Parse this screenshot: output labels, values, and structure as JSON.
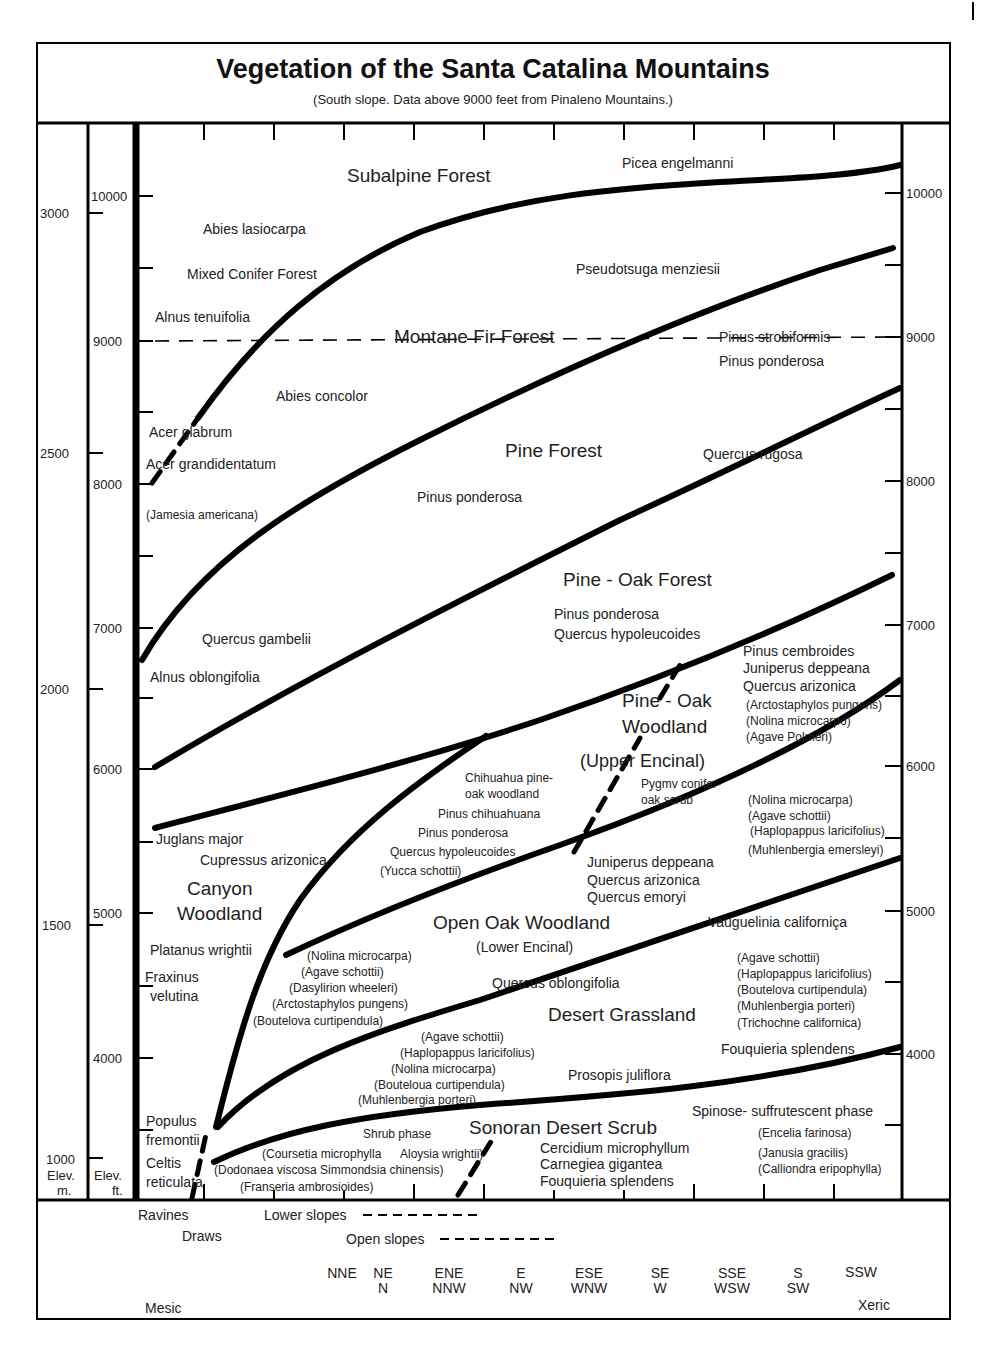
{
  "header": {
    "title": "Vegetation of the Santa Catalina Mountains",
    "subtitle": "(South slope. Data above 9000 feet from Pinaleno Mountains.)"
  },
  "axes": {
    "meters_label_1": "Elev.",
    "meters_label_2": "m.",
    "feet_label_1": "Elev.",
    "feet_label_2": "ft.",
    "meters_ticks": [
      "3000",
      "2500",
      "2000",
      "1500",
      "1000"
    ],
    "feet_ticks_left": [
      "10000",
      "9000",
      "8000",
      "7000",
      "6000",
      "5000",
      "4000"
    ],
    "feet_ticks_right": [
      "10000",
      "9000",
      "8000",
      "7000",
      "6000",
      "5000",
      "4000"
    ]
  },
  "zones": {
    "subalpine": "Subalpine Forest",
    "montane": "Montane Fir Forest",
    "pine": "Pine Forest",
    "pine_oak_forest": "Pine - Oak Forest",
    "pine_oak_woodland_1": "Pine - Oak",
    "pine_oak_woodland_2": "Woodland",
    "upper_encinal": "(Upper Encinal)",
    "canyon_1": "Canyon",
    "canyon_2": "Woodland",
    "open_oak": "Open Oak Woodland",
    "lower_encinal": "(Lower Encinal)",
    "desert_grassland": "Desert Grassland",
    "sonoran": "Sonoran Desert Scrub"
  },
  "species": {
    "picea": "Picea engelmanni",
    "abies_lasiocarpa": "Abies lasiocarpa",
    "mixed_conifer": "Mixed Conifer Forest",
    "alnus_tenuifolia": "Alnus tenuifolia",
    "pseudotsuga": "Pseudotsuga menziesii",
    "pinus_strobiformis": "Pinus strobiformis",
    "pinus_ponderosa_1": "Pinus ponderosa",
    "abies_concolor": "Abies concolor",
    "acer_glabrum": "Acer glabrum",
    "acer_grandidentatum": "Acer grandidentatum",
    "jamesia": "(Jamesia americana)",
    "pinus_ponderosa_2": "Pinus ponderosa",
    "quercus_rugosa": "Quercus rugosa",
    "quercus_gambelii": "Quercus gambelii",
    "alnus_oblongifolia": "Alnus oblongifolia",
    "pinus_ponderosa_3": "Pinus ponderosa",
    "quercus_hypoleucoides_1": "Quercus hypoleucoides",
    "pinus_cembroides": "Pinus cembroides",
    "juniperus_deppeana_1": "Juniperus deppeana",
    "quercus_arizonica_1": "Quercus arizonica",
    "arctostaphylos_1": "(Arctostaphylos pungens)",
    "nolina_microcarpo": "(Nolina microcarpo)",
    "agave_polmeri": "(Agave Polmeri)",
    "chihuahua_1": "Chihuahua pine-",
    "chihuahua_2": "oak woodland",
    "pinus_chihuahuana": "Pinus chihuahuana",
    "pinus_ponderosa_4": "Pinus ponderosa",
    "quercus_hypoleucoides_2": "Quercus hypoleucoides",
    "yucca": "(Yucca schottii)",
    "pygmy_1": "Pygmv conifer-",
    "pygmy_2": "oak scrub",
    "nolina_r1": "(Nolina microcarpa)",
    "agave_r1": "(Agave schottii)",
    "haplopappus_r1": "(Haplopappus laricifolius)",
    "muhlenbergia_emersleyi": "(Muhlenbergia emersleyi)",
    "juglans": "Juglans major",
    "cupressus": "Cupressus arizonica",
    "juniperus_deppeana_2": "Juniperus deppeana",
    "quercus_arizonica_2": "Quercus arizonica",
    "quercus_emoryi": "Quercus emoryi",
    "vauquelinia": "Vauguelinia californiça",
    "platanus": "Platanus wrightii",
    "fraxinus_1": "Fraxinus",
    "fraxinus_2": "velutina",
    "nolina_l": "(Nolina microcarpa)",
    "agave_l": "(Agave schottii)",
    "dasylirion": "(Dasylirion wheeleri)",
    "arctostaphylos_2": "(Arctostaphylos pungens)",
    "boutelova_l": "(Boutelova curtipendula)",
    "quercus_oblongifolia": "Quercus oblongifolia",
    "agave_m": "(Agave schottii)",
    "haplopappus_m": "(Haplopappus laricifolius)",
    "nolina_m": "(Nolina microcarpa)",
    "bouteloua_m": "(Bouteloua curtipendula)",
    "muhlenbergia_m": "(Muhlenbergia porteri)",
    "agave_r2": "(Agave schottii)",
    "haplopappus_r2": "(Haplopappus laricifolius)",
    "boutelova_r2": "(Boutelova curtipendula)",
    "muhlenbergia_r2": "(Muhlenbergia porteri)",
    "trichochne": "(Trichochne californica)",
    "fouquieria_1": "Fouquieria splendens",
    "prosopis": "Prosopis juliflora",
    "populus_1": "Populus",
    "populus_2": "fremontii",
    "celtis_1": "Celtis",
    "celtis_2": "reticulata",
    "shrub_phase": "Shrub phase",
    "coursetia": "(Coursetia microphylla",
    "aloysia": "Aloysia wrightii)",
    "dodonaea": "(Dodonaea viscosa Simmondsia chinensis)",
    "franseria": "(Franseria ambrosioides)",
    "cercidium": "Cercidium microphyllum",
    "carnegiea": "Carnegiea gigantea",
    "fouquieria_2": "Fouquieria splendens",
    "spinose": "Spinose- suffrutescent phase",
    "encelia": "(Encelia farinosa)",
    "janusia": "(Janusia gracilis)",
    "calliondra": "(Calliondra eripophylla)"
  },
  "footer": {
    "ravines": "Ravines",
    "draws": "Draws",
    "lower_slopes": "Lower slopes",
    "open_slopes": "Open slopes",
    "aspects": [
      {
        "top": "NNE",
        "bottom": ""
      },
      {
        "top": "NE",
        "bottom": "N"
      },
      {
        "top": "ENE",
        "bottom": "NNW"
      },
      {
        "top": "E",
        "bottom": "NW"
      },
      {
        "top": "ESE",
        "bottom": "WNW"
      },
      {
        "top": "SE",
        "bottom": "W"
      },
      {
        "top": "SSE",
        "bottom": "WSW"
      },
      {
        "top": "S",
        "bottom": "SW"
      },
      {
        "top": "SSW",
        "bottom": ""
      }
    ],
    "mesic": "Mesic",
    "xeric": "Xeric"
  }
}
